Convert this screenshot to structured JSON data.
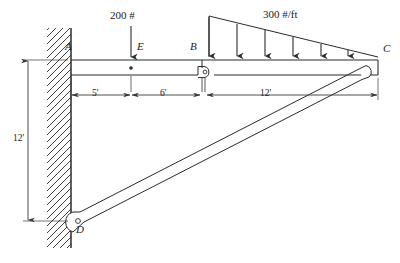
{
  "figure": {
    "background_color": "#ffffff",
    "line_color": "#2b2b2b",
    "dim_line_color": "#3a3a3a",
    "nodes": [
      {
        "id": "A",
        "label": "A",
        "x": 72,
        "y": 60,
        "desc": "beam-wall-connection"
      },
      {
        "id": "E",
        "label": "E",
        "x": 131,
        "y": 60,
        "desc": "point-load-location"
      },
      {
        "id": "B",
        "label": "B",
        "x": 202,
        "y": 60,
        "desc": "internal-hinge"
      },
      {
        "id": "C",
        "label": "C",
        "x": 378,
        "y": 60,
        "desc": "beam-strut-pin-joint"
      },
      {
        "id": "D",
        "label": "D",
        "x": 72,
        "y": 217,
        "desc": "strut-wall-pin-support"
      }
    ],
    "loads": {
      "point_load": {
        "label": "200 #",
        "magnitude": 200,
        "units": "#",
        "at_node": "E",
        "direction": "down"
      },
      "distributed_load": {
        "label_value": "300 ",
        "label_units_num": "#",
        "label_units_slash": "/",
        "label_units_den": "ft",
        "label": "300 #/ft",
        "peak_magnitude": 300,
        "units": "#/ft",
        "shape": "triangular",
        "from_node": "B",
        "to_node": "C",
        "peak_at": "B",
        "zero_at": "C",
        "arrow_count": 7
      }
    },
    "dimensions": [
      {
        "label": "5'",
        "value": 5,
        "units": "ft",
        "from": "A",
        "to": "E",
        "orientation": "horizontal"
      },
      {
        "label": "6'",
        "value": 6,
        "units": "ft",
        "from": "E",
        "to": "B",
        "orientation": "horizontal"
      },
      {
        "label": "12'",
        "value": 12,
        "units": "ft",
        "from": "B",
        "to": "C",
        "orientation": "horizontal"
      },
      {
        "label": "12'",
        "value": 12,
        "units": "ft",
        "from": "A",
        "to": "D",
        "orientation": "vertical"
      }
    ]
  }
}
